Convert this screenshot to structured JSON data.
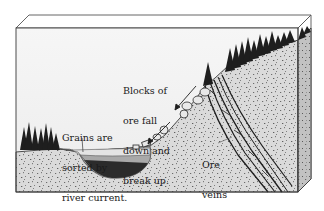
{
  "diagram": {
    "type": "geologic block diagram",
    "colors": {
      "background": "#ffffff",
      "sky": "#f2f2f2",
      "ground": "#d9d9d9",
      "ground_speckle": "#6b6b6b",
      "side_face": "#c4c4c4",
      "outline": "#3a3a3a",
      "trees": "#1e1e1e",
      "water": "#e6e6e6",
      "sediment_mid": "#a8a8a8",
      "sediment_dark": "#2b2b2b"
    },
    "labels": {
      "blocks": {
        "lines": [
          "Blocks of",
          "ore fall",
          "down and",
          "break up."
        ]
      },
      "grains": {
        "lines": [
          "Grains are",
          "sorted by",
          "river current."
        ]
      },
      "veins": {
        "lines": [
          "Ore",
          "veins"
        ]
      }
    },
    "elements": [
      "forest-left",
      "river-basin-with-sorted-sediment",
      "hillslope-with-falling-ore-blocks",
      "forest-ridge-right",
      "dipping-ore-veins"
    ]
  }
}
